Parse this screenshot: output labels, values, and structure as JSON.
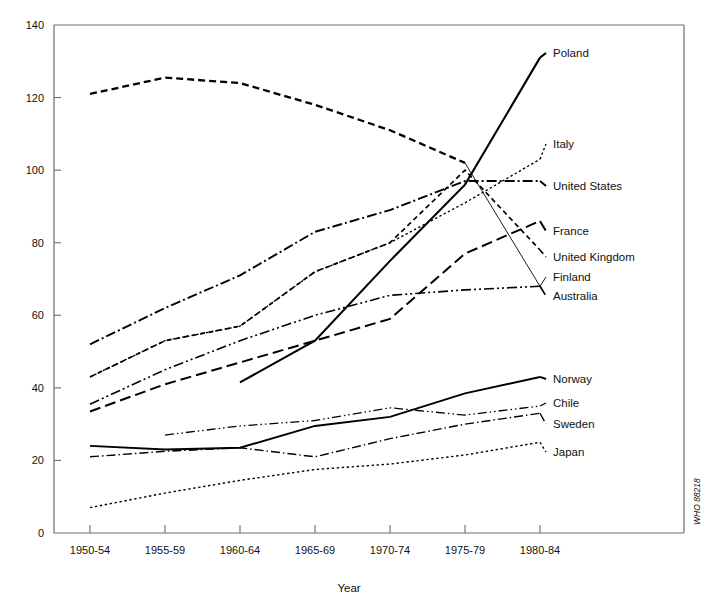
{
  "chart_data": {
    "type": "line",
    "title": "",
    "xlabel": "Year",
    "ylabel": "",
    "categories": [
      "1950-54",
      "1955-59",
      "1960-64",
      "1965-69",
      "1970-74",
      "1975-79",
      "1980-84"
    ],
    "yticks": [
      0,
      20,
      40,
      60,
      80,
      100,
      120,
      140
    ],
    "ylim": [
      0,
      140
    ],
    "grid": false,
    "legend_position": "right-inline-labels",
    "credit": "WHO 88218",
    "series": [
      {
        "name": "Poland",
        "style": "solid",
        "label_value": 131,
        "x": [
          "1960-64",
          "1965-69",
          "1970-74",
          "1975-79",
          "1980-84"
        ],
        "values": [
          41.5,
          53,
          75,
          96,
          131
        ]
      },
      {
        "name": "Italy",
        "style": "fine-dotted",
        "label_value": 103,
        "x": [
          "1950-54",
          "1955-59",
          "1960-64",
          "1965-69",
          "1970-74",
          "1975-79",
          "1980-84"
        ],
        "values": [
          43,
          53,
          57,
          72,
          80,
          91,
          103
        ]
      },
      {
        "name": "United States",
        "style": "dash-dot",
        "label_value": 97,
        "x": [
          "1950-54",
          "1955-59",
          "1960-64",
          "1965-69",
          "1970-74",
          "1975-79",
          "1980-84"
        ],
        "values": [
          52,
          62,
          71,
          83,
          89,
          97,
          97
        ]
      },
      {
        "name": "France",
        "style": "long-dash",
        "label_value": 86,
        "x": [
          "1950-54",
          "1955-59",
          "1960-64",
          "1965-69",
          "1970-74",
          "1975-79",
          "1980-84"
        ],
        "values": [
          33.5,
          41,
          47,
          53,
          59,
          77,
          86
        ]
      },
      {
        "name": "United Kingdom",
        "style": "dashed",
        "label_value": 78,
        "x": [
          "1950-54",
          "1955-59",
          "1960-64",
          "1965-69",
          "1970-74",
          "1975-79",
          "1980-84"
        ],
        "values": [
          43,
          53,
          57,
          72,
          80,
          100,
          78
        ]
      },
      {
        "name": "Finland",
        "style": "short-dash-heavy",
        "label_value": 68,
        "x": [
          "1950-54",
          "1955-59",
          "1960-64",
          "1965-69",
          "1970-74",
          "1975-79",
          "1980-84"
        ],
        "values": [
          121,
          125.5,
          124,
          118,
          111,
          102,
          68
        ]
      },
      {
        "name": "Australia",
        "style": "dash-dot-dot",
        "label_value": 68,
        "x": [
          "1950-54",
          "1955-59",
          "1960-64",
          "1965-69",
          "1970-74",
          "1975-79",
          "1980-84"
        ],
        "values": [
          35.5,
          45,
          53,
          60,
          65.5,
          67,
          68
        ]
      },
      {
        "name": "Norway",
        "style": "solid",
        "label_value": 43,
        "x": [
          "1950-54",
          "1955-59",
          "1960-64",
          "1965-69",
          "1970-74",
          "1975-79",
          "1980-84"
        ],
        "values": [
          24,
          23,
          23.5,
          29.5,
          32,
          38.5,
          43
        ]
      },
      {
        "name": "Chile",
        "style": "dash-dot-dot-fine",
        "label_value": 35,
        "x": [
          "1955-59",
          "1960-64",
          "1965-69",
          "1970-74",
          "1975-79",
          "1980-84"
        ],
        "values": [
          27,
          29.5,
          31,
          34.5,
          32.5,
          35
        ]
      },
      {
        "name": "Sweden",
        "style": "dash-dot-fine",
        "label_value": 33,
        "x": [
          "1950-54",
          "1955-59",
          "1960-64",
          "1965-69",
          "1970-74",
          "1975-79",
          "1980-84"
        ],
        "values": [
          21,
          22.5,
          23.5,
          21,
          26,
          30,
          33
        ]
      },
      {
        "name": "Japan",
        "style": "fine-dotted",
        "label_value": 25,
        "x": [
          "1950-54",
          "1955-59",
          "1960-64",
          "1965-69",
          "1970-74",
          "1975-79",
          "1980-84"
        ],
        "values": [
          7,
          11,
          14.5,
          17.5,
          19,
          21.5,
          25
        ]
      }
    ],
    "series_labels": [
      {
        "name": "Poland",
        "label_x": 553,
        "label_y": 57
      },
      {
        "name": "Italy",
        "label_x": 553,
        "label_y": 148
      },
      {
        "name": "United States",
        "label_x": 553,
        "label_y": 190
      },
      {
        "name": "France",
        "label_x": 553,
        "label_y": 235
      },
      {
        "name": "United Kingdom",
        "label_x": 553,
        "label_y": 261
      },
      {
        "name": "Finland",
        "label_x": 553,
        "label_y": 281
      },
      {
        "name": "Australia",
        "label_x": 553,
        "label_y": 300
      },
      {
        "name": "Norway",
        "label_x": 553,
        "label_y": 383
      },
      {
        "name": "Chile",
        "label_x": 553,
        "label_y": 407
      },
      {
        "name": "Sweden",
        "label_x": 553,
        "label_y": 428
      },
      {
        "name": "Japan",
        "label_x": 553,
        "label_y": 456
      }
    ]
  },
  "axes": {
    "x_axis_title": "Year",
    "x_tick_labels": [
      "1950-54",
      "1955-59",
      "1960-64",
      "1965-69",
      "1970-74",
      "1975-79",
      "1980-84"
    ],
    "y_tick_labels": [
      "0",
      "20",
      "40",
      "60",
      "80",
      "100",
      "120",
      "140"
    ]
  },
  "footer": {
    "credit": "WHO 88218"
  }
}
